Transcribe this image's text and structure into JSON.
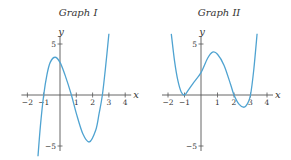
{
  "chart_data": [
    {
      "type": "line",
      "title": "Graph I",
      "xlabel": "x",
      "ylabel": "y",
      "xlim": [
        -2,
        4
      ],
      "ylim": [
        -5,
        5
      ],
      "x_ticks": [
        -2,
        -1,
        1,
        2,
        3,
        4
      ],
      "x_tick_labels": [
        "−2",
        "−1",
        "1",
        "2",
        "3",
        "4"
      ],
      "y_ticks": [
        5,
        -5
      ],
      "y_tick_labels": [
        "5",
        "−5"
      ],
      "grid": false,
      "curve_color": "#4fa3d1",
      "description": "Cubic polynomial with x-intercepts near -1, 0.7 and 2.6; local max about (-0.3, 3.7), local min about (1.8, -4.6)",
      "series": [
        {
          "name": "f",
          "x": [
            -1.35,
            -1.2,
            -1.0,
            -0.8,
            -0.6,
            -0.3,
            0.0,
            0.3,
            0.7,
            1.0,
            1.4,
            1.8,
            2.2,
            2.4,
            2.6,
            2.8,
            3.0
          ],
          "y": [
            -6.0,
            -3.0,
            0.0,
            2.0,
            3.2,
            3.7,
            3.2,
            2.0,
            0.0,
            -1.8,
            -3.8,
            -4.6,
            -3.4,
            -1.8,
            0.0,
            2.8,
            6.0
          ]
        }
      ]
    },
    {
      "type": "line",
      "title": "Graph II",
      "xlabel": "x",
      "ylabel": "y",
      "xlim": [
        -2,
        4
      ],
      "ylim": [
        -5,
        5
      ],
      "x_ticks": [
        -2,
        -1,
        1,
        2,
        3,
        4
      ],
      "x_tick_labels": [
        "−2",
        "−1",
        "1",
        "2",
        "3",
        "4"
      ],
      "y_ticks": [
        5,
        -5
      ],
      "y_tick_labels": [
        "5",
        "−5"
      ],
      "grid": false,
      "curve_color": "#4fa3d1",
      "description": "Quartic polynomial touching the x-axis at -1, crossing at 2 and 3; y-intercept about 2, local max about (0.7, 4.2), local min about (2.6, -1.2)",
      "series": [
        {
          "name": "g",
          "x": [
            -1.8,
            -1.6,
            -1.4,
            -1.2,
            -1.0,
            -0.8,
            -0.5,
            0.0,
            0.4,
            0.7,
            1.0,
            1.4,
            1.8,
            2.0,
            2.3,
            2.6,
            2.8,
            3.0,
            3.2,
            3.4
          ],
          "y": [
            6.0,
            3.3,
            1.4,
            0.3,
            0.0,
            0.4,
            1.1,
            2.2,
            3.6,
            4.2,
            4.0,
            2.9,
            1.0,
            0.0,
            -0.9,
            -1.2,
            -0.9,
            0.0,
            2.5,
            6.0
          ]
        }
      ]
    }
  ]
}
